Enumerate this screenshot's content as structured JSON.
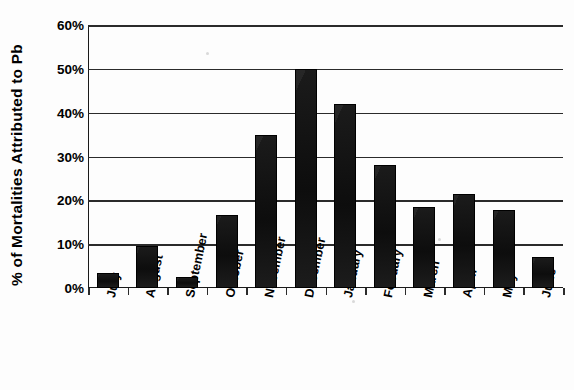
{
  "chart_data": {
    "type": "bar",
    "title": "",
    "xlabel": "",
    "ylabel": "% of Mortalities Attributed to Pb",
    "categories": [
      "July",
      "August",
      "September",
      "October",
      "November",
      "December",
      "January",
      "Febuary",
      "March",
      "April",
      "May",
      "June"
    ],
    "values": [
      3.4,
      9.5,
      2.6,
      16.6,
      35.0,
      50.0,
      42.0,
      28.0,
      18.5,
      21.5,
      17.8,
      7.0
    ],
    "ylim": [
      0,
      60
    ],
    "yticks": [
      0,
      10,
      20,
      30,
      40,
      50,
      60
    ],
    "ytick_labels": [
      "0%",
      "10%",
      "20%",
      "30%",
      "40%",
      "50%",
      "60%"
    ],
    "grid": true,
    "grid_axis": "y",
    "legend": false,
    "legend_position": "none",
    "bar_color": "#151515",
    "axis_color": "#2b2b2b",
    "background_color": "#ffffff",
    "xtick_label_rotation": -78
  },
  "axes": {
    "y_title": "% of Mortalities Attributed to Pb"
  }
}
